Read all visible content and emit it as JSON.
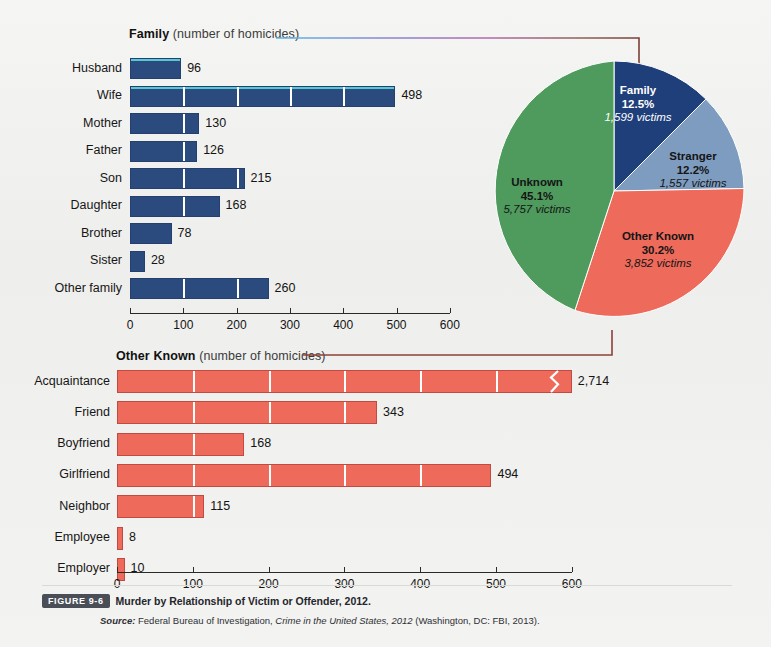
{
  "figure": {
    "badge": "FIGURE 9-6",
    "title": "Murder by Relationship of Victim or Offender, 2012.",
    "source_label": "Source:",
    "source_text_a": " Federal Bureau of Investigation, ",
    "source_italic": "Crime in the United States, 2012",
    "source_text_b": " (Washington, DC: FBI, 2013)."
  },
  "colors": {
    "family_blue": "#2b4a7d",
    "stranger_blue": "#7d9cbf",
    "other_known_red": "#ee6a5b",
    "unknown_green": "#4f9a5d",
    "axis": "#2a2a2a",
    "background": "#f2f2f0"
  },
  "chart_data": [
    {
      "type": "bar",
      "id": "family",
      "title": "Family",
      "subtitle": "(number of homicides)",
      "orientation": "horizontal",
      "categories": [
        "Husband",
        "Wife",
        "Mother",
        "Father",
        "Son",
        "Daughter",
        "Brother",
        "Sister",
        "Other family"
      ],
      "values": [
        96,
        498,
        130,
        126,
        215,
        168,
        78,
        28,
        260
      ],
      "value_labels": [
        "96",
        "498",
        "130",
        "126",
        "215",
        "168",
        "78",
        "28",
        "260"
      ],
      "xlabel": "",
      "ylabel": "",
      "xlim": [
        0,
        600
      ],
      "xticks": [
        0,
        100,
        200,
        300,
        400,
        500,
        600
      ],
      "xticklabels": [
        "0",
        "100",
        "200",
        "300",
        "400",
        "500",
        "600"
      ],
      "grid": true,
      "color": "#2b4a7d"
    },
    {
      "type": "pie",
      "id": "relationship-pie",
      "slices": [
        {
          "label": "Family",
          "percent": "12.5%",
          "percent_value": 12.5,
          "victims": "1,599 victims",
          "victims_value": 1599,
          "color": "#1f3f7a",
          "label_color": "light"
        },
        {
          "label": "Stranger",
          "percent": "12.2%",
          "percent_value": 12.2,
          "victims": "1,557 victims",
          "victims_value": 1557,
          "color": "#7d9cbf",
          "label_color": "dark"
        },
        {
          "label": "Other Known",
          "percent": "30.2%",
          "percent_value": 30.2,
          "victims": "3,852 victims",
          "victims_value": 3852,
          "color": "#ee6a5b",
          "label_color": "dark"
        },
        {
          "label": "Unknown",
          "percent": "45.1%",
          "percent_value": 45.1,
          "victims": "5,757 victims",
          "victims_value": 5757,
          "color": "#4f9a5d",
          "label_color": "dark"
        }
      ],
      "total_victims": 12765
    },
    {
      "type": "bar",
      "id": "other-known",
      "title": "Other Known",
      "subtitle": "(number of homicides)",
      "orientation": "horizontal",
      "categories": [
        "Acquaintance",
        "Friend",
        "Boyfriend",
        "Girlfriend",
        "Neighbor",
        "Employee",
        "Employer"
      ],
      "values": [
        2714,
        343,
        168,
        494,
        115,
        8,
        10
      ],
      "value_labels": [
        "2,714",
        "343",
        "168",
        "494",
        "115",
        "8",
        "10"
      ],
      "axis_break": {
        "category": "Acquaintance",
        "note": "bar truncated with zigzag break"
      },
      "xlabel": "",
      "ylabel": "",
      "xlim": [
        0,
        600
      ],
      "xticks": [
        0,
        100,
        200,
        300,
        400,
        500,
        600
      ],
      "xticklabels": [
        "0",
        "100",
        "200",
        "300",
        "400",
        "500",
        "600"
      ],
      "grid": true,
      "color": "#ee6a5b"
    }
  ]
}
